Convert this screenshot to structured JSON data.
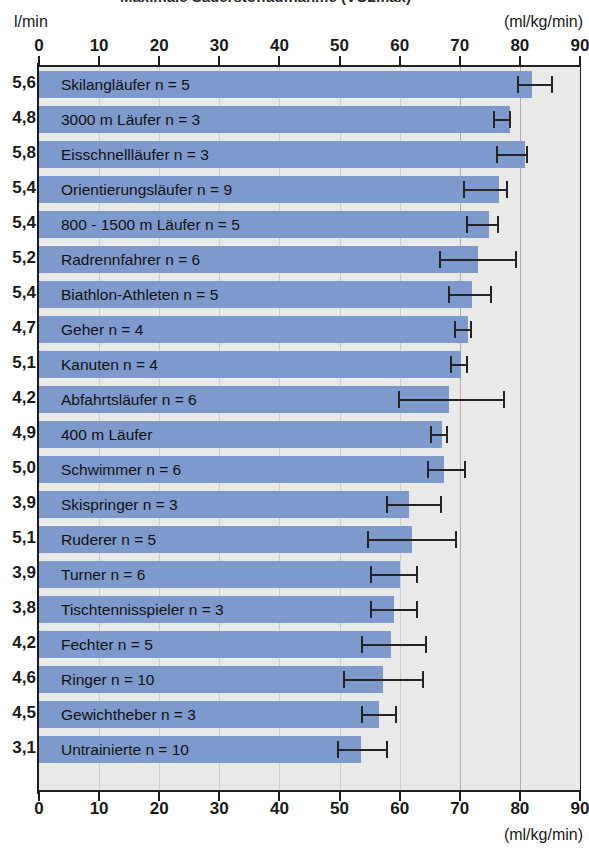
{
  "title": "Maximale Sauerstoffaufnahme (VO2max)",
  "units": {
    "left_top": "l/min",
    "right_top": "(ml/kg/min)",
    "right_bottom": "(ml/kg/min)"
  },
  "chart_data": {
    "type": "bar",
    "orientation": "horizontal",
    "title": "Maximale Sauerstoffaufnahme (VO2max)",
    "xlabel": "(ml/kg/min)",
    "ylabel": "l/min",
    "xlim": [
      0,
      90
    ],
    "xticks": [
      0,
      10,
      20,
      30,
      40,
      50,
      60,
      70,
      80,
      90
    ],
    "xtick_labels": [
      "0",
      "10",
      "20",
      "30",
      "40",
      "50",
      "60",
      "70",
      "80",
      "90"
    ],
    "grid": true,
    "gridlines_x": [
      10,
      20,
      30,
      40,
      50,
      60,
      70,
      80
    ],
    "legend": "none",
    "bar_color": "#7e9acd",
    "plot_background": "#e9e9e7",
    "error_bar_color": "#242424",
    "categories": [
      "Skilangläufer n = 5",
      "3000 m Läufer n = 3",
      "Eisschnellläufer n = 3",
      "Orientierungsläufer n = 9",
      "800 - 1500 m Läufer n = 5",
      "Radrennfahrer n = 6",
      "Biathlon-Athleten n = 5",
      "Geher n = 4",
      "Kanuten n = 4",
      "Abfahrtsläufer n = 6",
      "400 m Läufer",
      "Schwimmer n = 6",
      "Skispringer n = 3",
      "Ruderer n = 5",
      "Turner n = 6",
      "Tischtennisspieler n = 3",
      "Fechter n = 5",
      "Ringer n = 10",
      "Gewichtheber n = 3",
      "Untrainierte n = 10"
    ],
    "values": [
      82.0,
      78.3,
      80.8,
      76.5,
      74.8,
      73.0,
      72.0,
      71.3,
      70.2,
      68.2,
      67.0,
      67.3,
      61.5,
      62.0,
      60.0,
      59.0,
      58.5,
      57.3,
      56.5,
      53.5
    ],
    "err_low": [
      79.5,
      75.5,
      76.0,
      70.5,
      71.0,
      66.5,
      68.0,
      69.0,
      68.3,
      59.8,
      65.0,
      64.5,
      57.8,
      54.5,
      55.0,
      55.0,
      53.5,
      50.5,
      53.5,
      49.5
    ],
    "err_high": [
      85.5,
      78.5,
      81.3,
      78.0,
      76.5,
      79.5,
      75.3,
      72.0,
      71.3,
      77.5,
      68.0,
      71.0,
      67.0,
      69.5,
      63.0,
      63.0,
      64.5,
      64.0,
      59.5,
      58.0
    ],
    "secondary_values_l_per_min": [
      "5,6",
      "4,8",
      "5,8",
      "5,4",
      "5,4",
      "5,2",
      "5,4",
      "4,7",
      "5,1",
      "4,2",
      "4,9",
      "5,0",
      "3,9",
      "5,1",
      "3,9",
      "3,8",
      "4,2",
      "4,6",
      "4,5",
      "3,1"
    ]
  }
}
